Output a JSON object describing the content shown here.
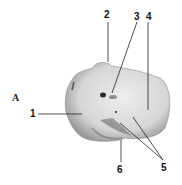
{
  "figure": {
    "panel_label": "A",
    "labels": [
      {
        "id": "1",
        "text": "1"
      },
      {
        "id": "2",
        "text": "2"
      },
      {
        "id": "3",
        "text": "3"
      },
      {
        "id": "4",
        "text": "4"
      },
      {
        "id": "5",
        "text": "5"
      },
      {
        "id": "6",
        "text": "6"
      }
    ],
    "colors": {
      "bone_light": "#e6e6e6",
      "bone_mid": "#bdbdbd",
      "bone_dark": "#555555",
      "leader": "#222222"
    }
  }
}
